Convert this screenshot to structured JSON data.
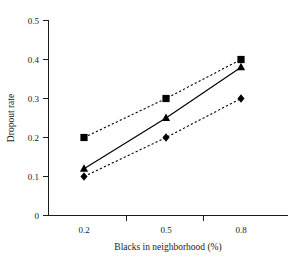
{
  "chart_data": {
    "type": "line",
    "title": "",
    "xlabel": "Blacks in neighborhood (%)",
    "ylabel": "Dropout rate",
    "categories": [
      "0.2",
      "0.5",
      "0.8"
    ],
    "x": [
      0.2,
      0.5,
      0.8
    ],
    "ylim": [
      0,
      0.5
    ],
    "yticks": [
      "0",
      "0.1",
      "0.2",
      "0.3",
      "0.4",
      "0.5"
    ],
    "ytick_values": [
      0,
      0.1,
      0.2,
      0.3,
      0.4,
      0.5
    ],
    "xticks": [
      "0.2",
      "0.5",
      "0.8"
    ],
    "grid": "off",
    "legend": "none",
    "series": [
      {
        "name": "upper",
        "marker": "square",
        "linestyle": "dashed",
        "color": "#000000",
        "values": [
          0.2,
          0.3,
          0.4
        ]
      },
      {
        "name": "middle",
        "marker": "triangle",
        "linestyle": "solid",
        "color": "#000000",
        "values": [
          0.12,
          0.25,
          0.38
        ]
      },
      {
        "name": "lower",
        "marker": "diamond",
        "linestyle": "dashed",
        "color": "#000000",
        "values": [
          0.1,
          0.2,
          0.3
        ]
      }
    ]
  },
  "axes": {
    "y_label": "Dropout rate",
    "x_label": "Blacks in neighborhood (%)",
    "y_tick_labels": [
      "0.5",
      "0.4",
      "0.3",
      "0.2",
      "0.1",
      "0"
    ],
    "x_tick_labels": [
      "0.2",
      "0.5",
      "0.8"
    ]
  },
  "colors": {
    "ink": "#1a1a1a",
    "marker": "#000000",
    "background": "#ffffff"
  }
}
